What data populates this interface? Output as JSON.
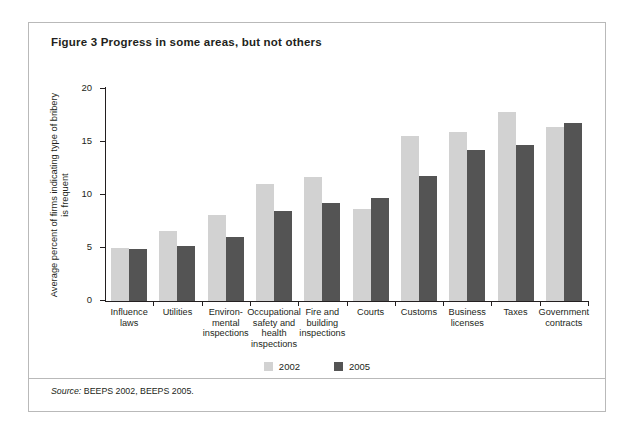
{
  "figure": {
    "title": "Figure 3  Progress in some areas, but not others",
    "source_prefix": "Source:",
    "source_text": "BEEPS 2002, BEEPS 2005."
  },
  "colors": {
    "series_2002": "#d2d2d2",
    "series_2005": "#545454",
    "axis": "#231f20",
    "frame": "#b9b9b9",
    "background": "#ffffff"
  },
  "chart_data": {
    "type": "bar",
    "title": "Figure 3  Progress in some areas, but not others",
    "xlabel": "",
    "ylabel": "Average percent of firms indicating type of bribery is frequent",
    "ylim": [
      0,
      20
    ],
    "yticks": [
      0,
      5,
      10,
      15,
      20
    ],
    "ytick_labels": [
      "0",
      "5",
      "10",
      "15",
      "20"
    ],
    "grid": false,
    "legend_position": "bottom-center",
    "categories": [
      "Influence laws",
      "Utilities",
      "Environ-\nmental\ninspections",
      "Occupational\nsafety and\nhealth\ninspections",
      "Fire and\nbuilding\ninspections",
      "Courts",
      "Customs",
      "Business\nlicenses",
      "Taxes",
      "Government\ncontracts"
    ],
    "category_lines": [
      [
        "Influence",
        "laws"
      ],
      [
        "Utilities"
      ],
      [
        "Environ-",
        "mental",
        "inspections"
      ],
      [
        "Occupational",
        "safety and",
        "health",
        "inspections"
      ],
      [
        "Fire and",
        "building",
        "inspections"
      ],
      [
        "Courts"
      ],
      [
        "Customs"
      ],
      [
        "Business",
        "licenses"
      ],
      [
        "Taxes"
      ],
      [
        "Government",
        "contracts"
      ]
    ],
    "series": [
      {
        "name": "2002",
        "color": "#d2d2d2",
        "values": [
          5.0,
          6.6,
          8.1,
          11.0,
          11.7,
          8.7,
          15.6,
          15.9,
          17.8,
          16.4
        ]
      },
      {
        "name": "2005",
        "color": "#545454",
        "values": [
          4.9,
          5.2,
          6.0,
          8.5,
          9.2,
          9.7,
          11.8,
          14.2,
          14.7,
          16.8
        ]
      }
    ]
  },
  "legend": {
    "items": [
      {
        "label": "2002",
        "color": "#d2d2d2"
      },
      {
        "label": "2005",
        "color": "#545454"
      }
    ]
  }
}
